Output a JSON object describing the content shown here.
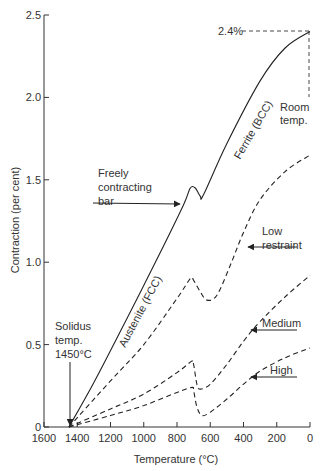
{
  "chart_data": {
    "type": "line",
    "title": "",
    "xlabel": "Temperature (°C)",
    "ylabel": "Contraction (per cent)",
    "xlim": [
      1600,
      0
    ],
    "ylim": [
      0,
      2.5
    ],
    "x_ticks": [
      1600,
      1400,
      1200,
      1000,
      800,
      600,
      400,
      200,
      0
    ],
    "y_ticks": [
      0,
      0.5,
      1.0,
      1.5,
      2.0,
      2.5
    ],
    "y_tick_labels": [
      "0",
      "0.5",
      "1.0",
      "1.5",
      "2.0",
      "2.5"
    ],
    "grid": false,
    "legend": "none (inline annotations)",
    "series": [
      {
        "name": "Freely contracting bar",
        "style": "solid",
        "x": [
          1450,
          1300,
          1100,
          900,
          760,
          720,
          690,
          660,
          640,
          500,
          300,
          150,
          0
        ],
        "y": [
          0,
          0.27,
          0.66,
          1.06,
          1.35,
          1.45,
          1.45,
          1.4,
          1.41,
          1.72,
          2.1,
          2.3,
          2.4
        ]
      },
      {
        "name": "Low restraint",
        "style": "dashed",
        "x": [
          1450,
          1200,
          1000,
          800,
          720,
          700,
          660,
          620,
          560,
          480,
          400,
          300,
          150,
          0
        ],
        "y": [
          0,
          0.28,
          0.5,
          0.78,
          0.9,
          0.89,
          0.82,
          0.77,
          0.8,
          0.98,
          1.18,
          1.38,
          1.55,
          1.65
        ]
      },
      {
        "name": "Medium",
        "style": "dashed",
        "x": [
          1450,
          1200,
          1000,
          800,
          710,
          700,
          680,
          660,
          600,
          500,
          400,
          300,
          150,
          0
        ],
        "y": [
          0,
          0.11,
          0.2,
          0.33,
          0.4,
          0.38,
          0.26,
          0.23,
          0.26,
          0.38,
          0.52,
          0.64,
          0.79,
          0.92
        ]
      },
      {
        "name": "High",
        "style": "dashed",
        "x": [
          1450,
          1200,
          1000,
          800,
          710,
          700,
          680,
          650,
          600,
          500,
          400,
          300,
          150,
          0
        ],
        "y": [
          0,
          0.07,
          0.13,
          0.21,
          0.24,
          0.22,
          0.12,
          0.07,
          0.09,
          0.17,
          0.26,
          0.34,
          0.42,
          0.48
        ]
      }
    ],
    "annotations": [
      {
        "text": "2.4%",
        "x": 0,
        "y": 2.4,
        "note": "dashed leader to y at room temperature"
      },
      {
        "text": "Room temp.",
        "x": 0
      },
      {
        "text": "Solidus temp. 1450°C",
        "x": 1450,
        "y": 0
      },
      {
        "text": "Freely contracting bar",
        "target": "solid curve"
      },
      {
        "text": "Low restraint"
      },
      {
        "text": "Medium"
      },
      {
        "text": "High"
      },
      {
        "text": "Austenite (FCC)",
        "region": "solid curve above ~720°C"
      },
      {
        "text": "Ferrite (BCC)",
        "region": "solid curve below ~650°C"
      }
    ]
  },
  "labels": {
    "xlabel": "Temperature (°C)",
    "ylabel": "Contraction (per cent)",
    "pct": "2.4%",
    "room1": "Room",
    "room2": "temp.",
    "solidus1": "Solidus",
    "solidus2": "temp.",
    "solidus3": "1450°C",
    "freely1": "Freely",
    "freely2": "contracting",
    "freely3": "bar",
    "low1": "Low",
    "low2": "restraint",
    "medium": "Medium",
    "high": "High",
    "austenite": "Austenite (FCC)",
    "ferrite": "Ferrite (BCC)"
  }
}
